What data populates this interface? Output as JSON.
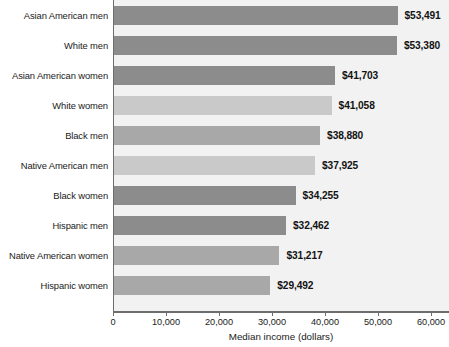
{
  "chart_data": {
    "type": "bar",
    "orientation": "horizontal",
    "title": "",
    "xlabel": "Median income (dollars)",
    "ylabel": "",
    "xlim": [
      0,
      60000
    ],
    "grid": false,
    "legend": null,
    "xticks": [
      {
        "value": 0,
        "label": "0"
      },
      {
        "value": 10000,
        "label": "10,000"
      },
      {
        "value": 20000,
        "label": "20,000"
      },
      {
        "value": 30000,
        "label": "30,000"
      },
      {
        "value": 40000,
        "label": "40,000"
      },
      {
        "value": 50000,
        "label": "50,000"
      },
      {
        "value": 60000,
        "label": "60,000"
      }
    ],
    "categories": [
      "Asian American men",
      "White men",
      "Asian American women",
      "White women",
      "Black men",
      "Native American men",
      "Black women",
      "Hispanic men",
      "Native American women",
      "Hispanic women"
    ],
    "values": [
      53491,
      53380,
      41703,
      41058,
      38880,
      37925,
      34255,
      32462,
      31217,
      29492
    ],
    "value_labels": [
      "$53,491",
      "$53,380",
      "$41,703",
      "$41,058",
      "$38,880",
      "$37,925",
      "$34,255",
      "$32,462",
      "$31,217",
      "$29,492"
    ],
    "bar_shades": [
      "dark",
      "dark",
      "dark",
      "light",
      "mid",
      "light",
      "dark",
      "dark",
      "mid",
      "mid"
    ],
    "colors": {
      "bar_dark": "#8c8c8c",
      "bar_mid": "#a8a8a8",
      "bar_light": "#c9c9c9",
      "plot_background": "#f2f2f2",
      "axis": "#6d6d6d",
      "text": "#1a1a1a"
    }
  }
}
